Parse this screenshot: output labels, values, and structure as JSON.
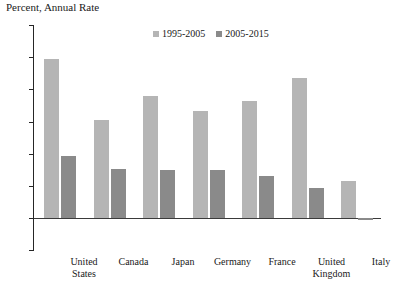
{
  "chart_data": {
    "type": "bar",
    "title": "Percent, Annual Rate",
    "xlabel": "",
    "ylabel": "",
    "ylim": [
      -0.5,
      3.0
    ],
    "ytick_step": 0.5,
    "yticks": [
      "3.0",
      "2.5",
      "2.0",
      "1.5",
      "1.0",
      "0.5",
      "0.0",
      "-0.5"
    ],
    "ytick_values": [
      3.0,
      2.5,
      2.0,
      1.5,
      1.0,
      0.5,
      0.0,
      -0.5
    ],
    "grid": false,
    "legend_position": "top-center",
    "categories": [
      "United States",
      "Canada",
      "Japan",
      "Germany",
      "France",
      "United Kingdom",
      "Italy"
    ],
    "category_lines": [
      [
        "United",
        "States"
      ],
      [
        "Canada"
      ],
      [
        "Japan"
      ],
      [
        "Germany"
      ],
      [
        "France"
      ],
      [
        "United",
        "Kingdom"
      ],
      [
        "Italy"
      ]
    ],
    "series": [
      {
        "name": "1995-2005",
        "color": "#b5b5b5",
        "values": [
          2.47,
          1.52,
          1.89,
          1.67,
          1.82,
          2.18,
          0.58
        ]
      },
      {
        "name": "2005-2015",
        "color": "#8a8a8a",
        "values": [
          0.97,
          0.76,
          0.75,
          0.74,
          0.66,
          0.46,
          -0.03
        ]
      }
    ]
  },
  "legend": {
    "entries": [
      {
        "label": "1995-2005",
        "color": "#b5b5b5"
      },
      {
        "label": "2005-2015",
        "color": "#8a8a8a"
      }
    ]
  },
  "axis": {
    "zero_line_color": "#3a3a3a",
    "axis_color": "#262626"
  }
}
